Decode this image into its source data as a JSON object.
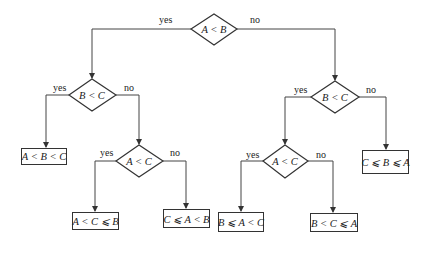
{
  "diagram": {
    "type": "decision-tree",
    "branch_labels": {
      "yes": "yes",
      "no": "no"
    },
    "decisions": {
      "root": "A < B",
      "left": "B < C",
      "left_inner": "A < C",
      "right": "B < C",
      "right_inner": "A < C"
    },
    "outcomes": {
      "o1": "A < B < C",
      "o2": "A < C ⩽ B",
      "o3": "C ⩽ A < B",
      "o4": "B ⩽ A < C",
      "o5": "B < C ⩽ A",
      "o6": "C ⩽ B ⩽ A"
    },
    "colors": {
      "line": "#444444",
      "text": "#222222",
      "background": "#ffffff"
    }
  }
}
